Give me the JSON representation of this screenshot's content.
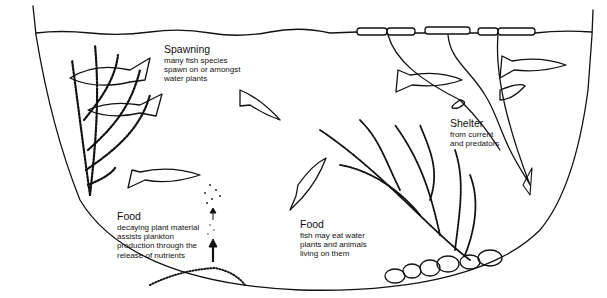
{
  "diagram": {
    "labels": [
      {
        "id": "spawning",
        "title": "Spawning",
        "description": "many fish species\nspawn on or amongst\nwater plants"
      },
      {
        "id": "food-decay",
        "title": "Food",
        "description": "decaying plant material\nassists plankton\nproduction through the\nrelease of nutrients"
      },
      {
        "id": "food-eat",
        "title": "Food",
        "description": "fish may eat water\nplants and animals\nliving on them"
      },
      {
        "id": "shelter",
        "title": "Shelter",
        "description": "from current\nand predators"
      }
    ],
    "elements": [
      "water-surface",
      "floating-leaves",
      "pond-basin",
      "submerged-weed-left",
      "branched-weed-center",
      "stemmed-plant-right",
      "fish",
      "plankton-particles",
      "up-arrows",
      "sediment",
      "stones"
    ],
    "colors": {
      "ink": "#111111",
      "background": "#ffffff"
    }
  }
}
